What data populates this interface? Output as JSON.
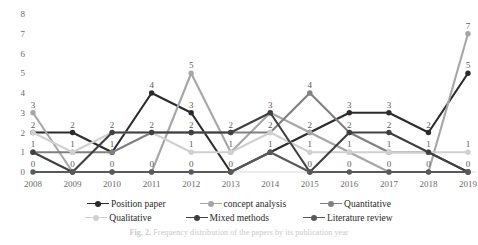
{
  "figure": {
    "caption_label": "Fig. 2.",
    "caption_text": "Frequency distribution of the papers by its publication year"
  },
  "legend": {
    "position": "bottom",
    "rows": [
      [
        {
          "label": "Position paper",
          "color": "#2b2b2b"
        },
        {
          "label": "concept analysis",
          "color": "#a6a6a6"
        },
        {
          "label": "Quantitative",
          "color": "#808080"
        }
      ],
      [
        {
          "label": "Qualitative",
          "color": "#d0d0d0"
        },
        {
          "label": "Mixed methods",
          "color": "#404040"
        },
        {
          "label": "Literature review",
          "color": "#595959"
        }
      ]
    ]
  },
  "chart_data": {
    "type": "line",
    "title": "",
    "xlabel": "",
    "ylabel": "",
    "ylim": [
      0,
      8
    ],
    "yticks": [
      0,
      1,
      2,
      3,
      4,
      5,
      6,
      7,
      8
    ],
    "grid": false,
    "markers": true,
    "data_labels": true,
    "categories": [
      "2008",
      "2009",
      "2010",
      "2011",
      "2012",
      "2013",
      "2014",
      "2015",
      "2016",
      "2017",
      "2018",
      "2019"
    ],
    "series": [
      {
        "name": "Position paper",
        "color": "#2b2b2b",
        "values": [
          2,
          2,
          1,
          4,
          3,
          0,
          1,
          2,
          3,
          3,
          2,
          5
        ]
      },
      {
        "name": "concept analysis",
        "color": "#a6a6a6",
        "values": [
          3,
          0,
          0,
          0,
          5,
          1,
          3,
          2,
          1,
          0,
          0,
          7
        ]
      },
      {
        "name": "Quantitative",
        "color": "#808080",
        "values": [
          1,
          1,
          1,
          2,
          2,
          2,
          2,
          4,
          2,
          1,
          1,
          0
        ]
      },
      {
        "name": "Qualitative",
        "color": "#d0d0d0",
        "values": [
          2,
          1,
          2,
          2,
          1,
          1,
          2,
          1,
          1,
          1,
          1,
          1
        ]
      },
      {
        "name": "Mixed methods",
        "color": "#404040",
        "values": [
          1,
          0,
          2,
          2,
          2,
          2,
          3,
          0,
          2,
          2,
          1,
          0
        ]
      },
      {
        "name": "Literature review",
        "color": "#595959",
        "values": [
          0,
          0,
          0,
          0,
          0,
          0,
          1,
          0,
          0,
          0,
          0,
          0
        ]
      }
    ],
    "point_labels": [
      {
        "x": "2008",
        "value": "3",
        "dx": 0,
        "dy": -22
      },
      {
        "x": "2008",
        "value": "2",
        "dx": 0,
        "dy": -9
      },
      {
        "x": "2008",
        "value": "1",
        "dx": 0,
        "dy": 9
      },
      {
        "x": "2008",
        "value": "0",
        "dx": 0,
        "dy": 24
      },
      {
        "x": "2009",
        "value": "2",
        "dx": 0,
        "dy": -9
      },
      {
        "x": "2009",
        "value": "1",
        "dx": 0,
        "dy": 9
      },
      {
        "x": "2009",
        "value": "0",
        "dx": 0,
        "dy": 24
      },
      {
        "x": "2010",
        "value": "2",
        "dx": 0,
        "dy": -9
      },
      {
        "x": "2010",
        "value": "1",
        "dx": 0,
        "dy": 9
      },
      {
        "x": "2010",
        "value": "0",
        "dx": 0,
        "dy": 24
      },
      {
        "x": "2011",
        "value": "4",
        "dx": 0,
        "dy": -9
      },
      {
        "x": "2011",
        "value": "2",
        "dx": 0,
        "dy": -9
      },
      {
        "x": "2011",
        "value": "0",
        "dx": 0,
        "dy": 24
      },
      {
        "x": "2012",
        "value": "5",
        "dx": 0,
        "dy": -9
      },
      {
        "x": "2012",
        "value": "3",
        "dx": 0,
        "dy": -9
      },
      {
        "x": "2012",
        "value": "2",
        "dx": 0,
        "dy": -9
      },
      {
        "x": "2012",
        "value": "0",
        "dx": 0,
        "dy": 24
      },
      {
        "x": "2013",
        "value": "2",
        "dx": 0,
        "dy": -9
      },
      {
        "x": "2013",
        "value": "1",
        "dx": 0,
        "dy": 9
      },
      {
        "x": "2013",
        "value": "0",
        "dx": 0,
        "dy": 14
      },
      {
        "x": "2014",
        "value": "3",
        "dx": 0,
        "dy": -9
      },
      {
        "x": "2014",
        "value": "2",
        "dx": 0,
        "dy": -9
      },
      {
        "x": "2014",
        "value": "1",
        "dx": 0,
        "dy": 9
      },
      {
        "x": "2014",
        "value": "0",
        "dx": 0,
        "dy": 24
      },
      {
        "x": "2015",
        "value": "4",
        "dx": 0,
        "dy": -9
      },
      {
        "x": "2015",
        "value": "2",
        "dx": 0,
        "dy": -9
      },
      {
        "x": "2015",
        "value": "0",
        "dx": 0,
        "dy": 14
      },
      {
        "x": "2016",
        "value": "3",
        "dx": 0,
        "dy": -9
      },
      {
        "x": "2016",
        "value": "2",
        "dx": 0,
        "dy": -9
      },
      {
        "x": "2016",
        "value": "1",
        "dx": 0,
        "dy": 9
      },
      {
        "x": "2016",
        "value": "0",
        "dx": 0,
        "dy": 24
      },
      {
        "x": "2017",
        "value": "3",
        "dx": 0,
        "dy": -9
      },
      {
        "x": "2017",
        "value": "2",
        "dx": 0,
        "dy": -9
      },
      {
        "x": "2017",
        "value": "1",
        "dx": 0,
        "dy": 9
      },
      {
        "x": "2017",
        "value": "0",
        "dx": 0,
        "dy": 24
      },
      {
        "x": "2018",
        "value": "2",
        "dx": 0,
        "dy": -9
      },
      {
        "x": "2018",
        "value": "1",
        "dx": 0,
        "dy": 9
      },
      {
        "x": "2019",
        "value": "7",
        "dx": 0,
        "dy": -9
      },
      {
        "x": "2019",
        "value": "5",
        "dx": 0,
        "dy": -9
      },
      {
        "x": "2019",
        "value": "1",
        "dx": 0,
        "dy": -9
      },
      {
        "x": "2019",
        "value": "0",
        "dx": 0,
        "dy": 12
      }
    ]
  }
}
